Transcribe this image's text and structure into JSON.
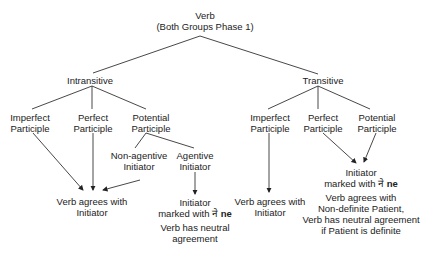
{
  "root": {
    "line1": "Verb",
    "line2": "(Both Groups Phase 1)"
  },
  "intransitive": {
    "label": "Intransitive",
    "children": [
      {
        "line1": "Imperfect",
        "line2": "Participle"
      },
      {
        "line1": "Perfect",
        "line2": "Participle"
      },
      {
        "line1": "Potential",
        "line2": "Participle"
      }
    ],
    "potential_children": [
      {
        "line1": "Non-agentive",
        "line2": "Initiator"
      },
      {
        "line1": "Agentive",
        "line2": "Initiator"
      }
    ],
    "outcome_agrees": {
      "line1": "Verb agrees with",
      "line2": "Initiator"
    },
    "outcome_agentive": {
      "line1": "Initiator",
      "line2_prefix": "marked with ",
      "marker_devanagari": "ने",
      "marker_latin": "ne",
      "line3": "Verb has neutral",
      "line4": "agreement"
    }
  },
  "transitive": {
    "label": "Transitive",
    "children": [
      {
        "line1": "Imperfect",
        "line2": "Participle"
      },
      {
        "line1": "Perfect",
        "line2": "Participle"
      },
      {
        "line1": "Potential",
        "line2": "Participle"
      }
    ],
    "outcome_imperfect": {
      "line1": "Verb agrees with",
      "line2": "Initiator"
    },
    "outcome_perfect_potential": {
      "line1": "Initiator",
      "line2_prefix": "marked with ",
      "marker_devanagari": "ने",
      "marker_latin": "ne",
      "line3": "Verb agrees with",
      "line4": "Non-definite Patient,",
      "line5": "Verb has neutral agreement",
      "line6": "if Patient is definite"
    }
  },
  "colors": {
    "line": "#333333",
    "text": "#222222"
  }
}
